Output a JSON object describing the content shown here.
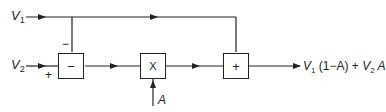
{
  "diagram": {
    "type": "block-diagram",
    "inputs": {
      "v1": {
        "symbol": "V",
        "subscript": "1"
      },
      "v2": {
        "symbol": "V",
        "subscript": "2"
      },
      "a": {
        "symbol": "A"
      }
    },
    "blocks": {
      "subtractor": {
        "label": "−"
      },
      "multiplier": {
        "label": "X"
      },
      "adder": {
        "label": "+"
      }
    },
    "signs": {
      "v1_into_subtractor": "−",
      "v2_into_subtractor": "+"
    },
    "output": {
      "v1_symbol": "V",
      "v1_sub": "1",
      "term1_factor": " (1−A)",
      "plus": " + ",
      "v2_symbol": "V",
      "v2_sub": "2",
      "term2_factor": " A"
    },
    "colors": {
      "line": "#222222",
      "background": "#ffffff"
    }
  }
}
